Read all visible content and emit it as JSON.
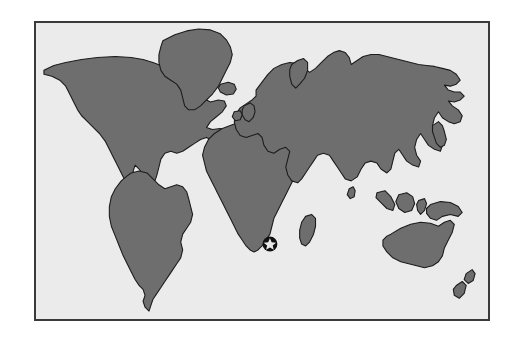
{
  "figure": {
    "kind": "world-map",
    "title": "",
    "caption": "",
    "projection": "equirectangular",
    "frame": {
      "border_color": "#3a3a3a",
      "border_width_px": 2,
      "x": 34,
      "y": 21,
      "width": 456,
      "height": 300
    },
    "colors": {
      "page_background": "#ffffff",
      "ocean_background": "#ebebeb",
      "land_fill": "#6e6e6e",
      "land_outline": "#1c1c1c",
      "marker_disc": "#111111",
      "marker_star": "#e8e8e8"
    }
  },
  "marker": {
    "name": "star-location-marker",
    "label": "",
    "shape": "filled-circle-with-star",
    "region": "Southern Africa",
    "position_px": {
      "x": 272,
      "y": 247
    },
    "disc_radius_px": 7,
    "star_points": 5
  },
  "landmasses": [
    {
      "id": "north-america",
      "label": "North America"
    },
    {
      "id": "greenland",
      "label": "Greenland"
    },
    {
      "id": "iceland",
      "label": "Iceland"
    },
    {
      "id": "south-america",
      "label": "South America"
    },
    {
      "id": "africa",
      "label": "Africa"
    },
    {
      "id": "madagascar",
      "label": "Madagascar"
    },
    {
      "id": "eurasia",
      "label": "Eurasia"
    },
    {
      "id": "british-isles",
      "label": "British Isles"
    },
    {
      "id": "ireland",
      "label": "Ireland"
    },
    {
      "id": "japan",
      "label": "Japan"
    },
    {
      "id": "sri-lanka",
      "label": "Sri Lanka"
    },
    {
      "id": "borneo",
      "label": "Borneo"
    },
    {
      "id": "sumatra",
      "label": "Sumatra"
    },
    {
      "id": "sulawesi",
      "label": "Sulawesi"
    },
    {
      "id": "new-guinea",
      "label": "New Guinea"
    },
    {
      "id": "australia",
      "label": "Australia"
    },
    {
      "id": "new-zealand-north",
      "label": "New Zealand North Island"
    },
    {
      "id": "new-zealand-south",
      "label": "New Zealand South Island"
    }
  ]
}
